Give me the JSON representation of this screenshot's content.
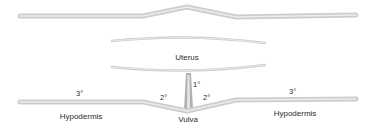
{
  "diagram": {
    "labels": {
      "uterus": "Uterus",
      "vulva": "Vulva",
      "hypodermis_left": "Hypodermis",
      "hypodermis_right": "Hypodermis",
      "primary": "1°",
      "secondary_left": "2°",
      "secondary_right": "2°",
      "tertiary_left": "3°",
      "tertiary_right": "3°"
    },
    "colors": {
      "tissue_outer": "#cfcfcf",
      "tissue_inner": "#ececec",
      "text": "#2a2a2a",
      "anchor_cell": "#a8a8a8"
    }
  }
}
